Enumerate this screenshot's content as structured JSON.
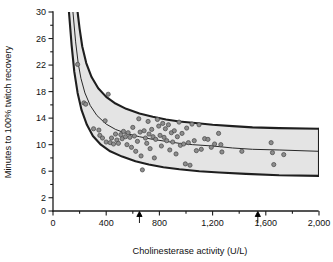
{
  "chart_data": {
    "type": "scatter",
    "title": "",
    "xlabel": "Cholinesterase activity (U/L)",
    "ylabel": "Minutes to 100% twitch recovery",
    "xlim": [
      0,
      2000
    ],
    "ylim": [
      0,
      30
    ],
    "xticks": [
      0,
      200,
      400,
      600,
      800,
      1000,
      1200,
      1400,
      1600,
      1800,
      2000
    ],
    "xtick_labels": [
      "0",
      "",
      "400",
      "",
      "800",
      "",
      "1,200",
      "",
      "1,600",
      "",
      "2,000"
    ],
    "yticks": [
      0,
      2,
      4,
      6,
      8,
      10,
      12,
      14,
      16,
      18,
      20,
      22,
      24,
      26,
      28,
      30
    ],
    "ytick_labels": [
      "0",
      "2",
      "",
      "6",
      "",
      "10",
      "",
      "14",
      "",
      "18",
      "",
      "22",
      "",
      "26",
      "",
      "30"
    ],
    "grid": false,
    "legend": "none",
    "annotations": [
      {
        "name": "lower-reference-arrow",
        "x": 650,
        "label": "",
        "direction": "up"
      },
      {
        "name": "upper-reference-arrow",
        "x": 1540,
        "label": "",
        "direction": "up"
      }
    ],
    "fit_curve": {
      "name": "regression-curve",
      "form": "hyperbolic",
      "points": [
        [
          150,
          30.0
        ],
        [
          170,
          25.5
        ],
        [
          190,
          22.2
        ],
        [
          210,
          20.0
        ],
        [
          240,
          17.8
        ],
        [
          280,
          15.9
        ],
        [
          330,
          14.4
        ],
        [
          400,
          13.1
        ],
        [
          470,
          12.3
        ],
        [
          550,
          11.7
        ],
        [
          650,
          11.2
        ],
        [
          750,
          10.8
        ],
        [
          850,
          10.5
        ],
        [
          950,
          10.2
        ],
        [
          1050,
          10.0
        ],
        [
          1200,
          9.8
        ],
        [
          1350,
          9.5
        ],
        [
          1500,
          9.3
        ],
        [
          1700,
          9.2
        ],
        [
          2000,
          9.0
        ]
      ]
    },
    "band_upper": {
      "name": "upper-confidence-bound",
      "points": [
        [
          185,
          30.0
        ],
        [
          200,
          27.5
        ],
        [
          220,
          24.8
        ],
        [
          250,
          22.3
        ],
        [
          290,
          20.2
        ],
        [
          340,
          18.5
        ],
        [
          400,
          17.2
        ],
        [
          470,
          16.2
        ],
        [
          550,
          15.4
        ],
        [
          650,
          14.7
        ],
        [
          750,
          14.2
        ],
        [
          850,
          13.8
        ],
        [
          950,
          13.5
        ],
        [
          1050,
          13.3
        ],
        [
          1200,
          13.0
        ],
        [
          1350,
          12.8
        ],
        [
          1500,
          12.6
        ],
        [
          1700,
          12.5
        ],
        [
          2000,
          12.4
        ]
      ]
    },
    "band_lower": {
      "name": "lower-confidence-bound",
      "points": [
        [
          120,
          30.0
        ],
        [
          140,
          25.0
        ],
        [
          160,
          21.0
        ],
        [
          185,
          17.8
        ],
        [
          215,
          15.2
        ],
        [
          255,
          13.0
        ],
        [
          300,
          11.3
        ],
        [
          360,
          10.0
        ],
        [
          430,
          9.0
        ],
        [
          520,
          8.2
        ],
        [
          620,
          7.5
        ],
        [
          720,
          7.0
        ],
        [
          830,
          6.6
        ],
        [
          950,
          6.3
        ],
        [
          1100,
          6.0
        ],
        [
          1250,
          5.8
        ],
        [
          1450,
          5.6
        ],
        [
          1700,
          5.4
        ],
        [
          2000,
          5.3
        ]
      ]
    },
    "series": [
      {
        "name": "Patients",
        "marker": "circle",
        "color": "#8d8d8d",
        "points": [
          [
            185,
            22.1
          ],
          [
            232,
            16.3
          ],
          [
            246,
            16.1
          ],
          [
            305,
            12.4
          ],
          [
            345,
            12.2
          ],
          [
            352,
            11.4
          ],
          [
            372,
            11.0
          ],
          [
            392,
            13.6
          ],
          [
            400,
            10.4
          ],
          [
            415,
            17.6
          ],
          [
            430,
            10.3
          ],
          [
            440,
            11.0
          ],
          [
            455,
            10.1
          ],
          [
            470,
            11.6
          ],
          [
            480,
            10.7
          ],
          [
            492,
            10.2
          ],
          [
            510,
            11.5
          ],
          [
            520,
            10.9
          ],
          [
            530,
            12.0
          ],
          [
            545,
            11.2
          ],
          [
            556,
            10.0
          ],
          [
            565,
            11.8
          ],
          [
            578,
            11.1
          ],
          [
            590,
            9.6
          ],
          [
            600,
            12.6
          ],
          [
            612,
            11.3
          ],
          [
            622,
            9.0
          ],
          [
            635,
            10.5
          ],
          [
            645,
            13.9
          ],
          [
            655,
            11.9
          ],
          [
            662,
            8.3
          ],
          [
            672,
            6.2
          ],
          [
            685,
            12.1
          ],
          [
            695,
            11.0
          ],
          [
            705,
            10.2
          ],
          [
            715,
            13.5
          ],
          [
            722,
            11.6
          ],
          [
            730,
            9.4
          ],
          [
            742,
            12.3
          ],
          [
            752,
            11.2
          ],
          [
            762,
            8.0
          ],
          [
            772,
            10.8
          ],
          [
            785,
            13.8
          ],
          [
            795,
            12.8
          ],
          [
            805,
            11.4
          ],
          [
            815,
            9.8
          ],
          [
            825,
            13.2
          ],
          [
            835,
            11.1
          ],
          [
            845,
            12.4
          ],
          [
            855,
            10.6
          ],
          [
            868,
            13.0
          ],
          [
            878,
            9.2
          ],
          [
            890,
            11.8
          ],
          [
            900,
            10.4
          ],
          [
            912,
            12.1
          ],
          [
            925,
            8.6
          ],
          [
            935,
            11.2
          ],
          [
            948,
            13.4
          ],
          [
            958,
            9.9
          ],
          [
            970,
            11.7
          ],
          [
            982,
            10.1
          ],
          [
            995,
            7.1
          ],
          [
            1005,
            12.5
          ],
          [
            1018,
            10.3
          ],
          [
            1030,
            6.9
          ],
          [
            1045,
            13.1
          ],
          [
            1062,
            10.6
          ],
          [
            1078,
            9.1
          ],
          [
            1098,
            13.0
          ],
          [
            1115,
            9.3
          ],
          [
            1140,
            10.9
          ],
          [
            1165,
            10.8
          ],
          [
            1190,
            9.6
          ],
          [
            1215,
            10.1
          ],
          [
            1245,
            11.7
          ],
          [
            1262,
            10.0
          ],
          [
            1270,
            8.9
          ],
          [
            1420,
            9.0
          ],
          [
            1640,
            10.3
          ],
          [
            1650,
            8.8
          ],
          [
            1660,
            7.0
          ],
          [
            1735,
            8.5
          ]
        ]
      }
    ]
  },
  "axis_label_x": "Cholinesterase activity (U/L)",
  "axis_label_y": "Minutes to 100% twitch recovery"
}
